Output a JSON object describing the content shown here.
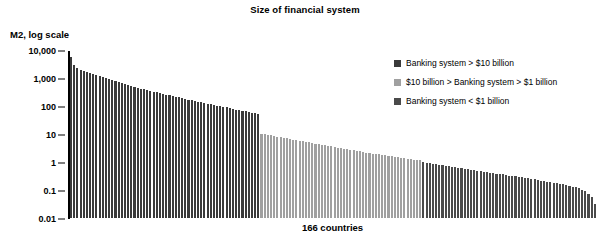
{
  "chart_data": {
    "type": "bar",
    "title": "Size of financial system",
    "ylabel": "M2, log scale",
    "xlabel": "166 countries",
    "yscale": "log",
    "ylim": [
      0.01,
      10000
    ],
    "ytick_labels": [
      "10,000",
      "1,000",
      "100",
      "10",
      "1",
      "0.1",
      "0.01"
    ],
    "ytick_values": [
      10000,
      1000,
      100,
      10,
      1,
      0.1,
      0.01
    ],
    "grid": false,
    "legend_position": "upper-right",
    "n_categories": 166,
    "colors": {
      "large": "#3a3a3a",
      "medium": "#a0a0a0",
      "small": "#4a4a4a",
      "axis": "#000000",
      "background": "#ffffff"
    },
    "legend": [
      {
        "label": "Banking system > $10 billion",
        "color": "#3a3a3a",
        "group": "large"
      },
      {
        "label": "$10 billion > Banking system > $1 billion",
        "color": "#a0a0a0",
        "group": "medium"
      },
      {
        "label": "Banking system < $1 billion",
        "color": "#4a4a4a",
        "group": "small"
      }
    ],
    "group_boundaries": {
      "large_end_index": 59,
      "medium_end_index": 110
    },
    "values": [
      5000,
      2600,
      2050,
      1800,
      1650,
      1500,
      1380,
      1250,
      1150,
      1050,
      980,
      900,
      830,
      770,
      700,
      640,
      590,
      545,
      500,
      470,
      440,
      410,
      385,
      360,
      340,
      320,
      300,
      282,
      265,
      250,
      236,
      222,
      210,
      198,
      186,
      176,
      166,
      157,
      148,
      140,
      133,
      126,
      119,
      113,
      107,
      101,
      96,
      91,
      86,
      82,
      77,
      73,
      69,
      66,
      62,
      59,
      56,
      53,
      50,
      47,
      9.5,
      9.0,
      8.6,
      8.2,
      7.8,
      7.4,
      7.0,
      6.7,
      6.4,
      6.1,
      5.8,
      5.5,
      5.2,
      5.0,
      4.8,
      4.6,
      4.4,
      4.2,
      4.0,
      3.8,
      3.6,
      3.45,
      3.3,
      3.15,
      3.0,
      2.85,
      2.7,
      2.6,
      2.5,
      2.4,
      2.3,
      2.2,
      2.1,
      2.0,
      1.92,
      1.85,
      1.78,
      1.72,
      1.66,
      1.6,
      1.54,
      1.48,
      1.42,
      1.37,
      1.32,
      1.27,
      1.22,
      1.18,
      1.13,
      1.09,
      1.05,
      0.92,
      0.88,
      0.84,
      0.8,
      0.77,
      0.74,
      0.71,
      0.68,
      0.65,
      0.62,
      0.6,
      0.57,
      0.55,
      0.53,
      0.51,
      0.49,
      0.47,
      0.45,
      0.43,
      0.41,
      0.4,
      0.38,
      0.37,
      0.35,
      0.34,
      0.33,
      0.31,
      0.3,
      0.29,
      0.28,
      0.27,
      0.26,
      0.25,
      0.24,
      0.23,
      0.22,
      0.21,
      0.2,
      0.19,
      0.185,
      0.175,
      0.168,
      0.16,
      0.152,
      0.145,
      0.138,
      0.13,
      0.122,
      0.115,
      0.105,
      0.095,
      0.082,
      0.068,
      0.05,
      0.03
    ]
  }
}
